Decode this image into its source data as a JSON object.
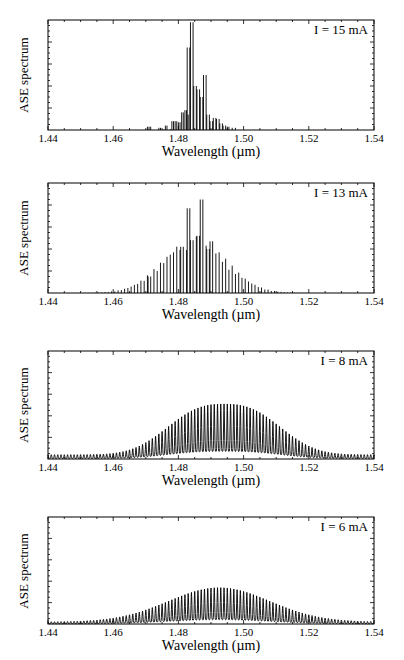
{
  "figure": {
    "panels": [
      {
        "id": "p1",
        "top": 20,
        "height": 110,
        "annotation": "I = 15 mA"
      },
      {
        "id": "p2",
        "top": 183,
        "height": 110,
        "annotation": "I = 13 mA"
      },
      {
        "id": "p3",
        "top": 351,
        "height": 108,
        "annotation": "I = 8 mA"
      },
      {
        "id": "p4",
        "top": 517,
        "height": 107,
        "annotation": "I = 6 mA"
      }
    ]
  },
  "chart_data": [
    {
      "type": "line",
      "title": "",
      "annotation": "I = 15 mA",
      "xlabel": "Wavelength (µm)",
      "ylabel": "ASE spectrum",
      "xlim": [
        1.44,
        1.54
      ],
      "ylim": [
        0,
        1
      ],
      "xticks": [
        "1.44",
        "1.46",
        "1.48",
        "1.50",
        "1.52",
        "1.54"
      ],
      "yticks_labeled": false,
      "grid": false,
      "description": "Narrow multimode spectrum concentrated 1.470-1.497 um; dominant longitudinal mode near 1.4837 um",
      "mode_spacing_um": 0.001,
      "envelope": {
        "center": 1.4845,
        "width": 0.004,
        "floor": 0.0
      },
      "peaks": [
        {
          "x": 1.471,
          "y": 0.03
        },
        {
          "x": 1.474,
          "y": 0.02
        },
        {
          "x": 1.476,
          "y": 0.04
        },
        {
          "x": 1.478,
          "y": 0.08
        },
        {
          "x": 1.479,
          "y": 0.08
        },
        {
          "x": 1.48,
          "y": 0.07
        },
        {
          "x": 1.481,
          "y": 0.16
        },
        {
          "x": 1.482,
          "y": 0.18
        },
        {
          "x": 1.483,
          "y": 0.14
        },
        {
          "x": 1.4827,
          "y": 0.75
        },
        {
          "x": 1.4837,
          "y": 0.98
        },
        {
          "x": 1.4847,
          "y": 0.4
        },
        {
          "x": 1.4857,
          "y": 0.37
        },
        {
          "x": 1.4867,
          "y": 0.3
        },
        {
          "x": 1.4877,
          "y": 0.5
        },
        {
          "x": 1.4887,
          "y": 0.14
        },
        {
          "x": 1.4897,
          "y": 0.08
        },
        {
          "x": 1.4907,
          "y": 0.11
        },
        {
          "x": 1.4917,
          "y": 0.1
        },
        {
          "x": 1.4927,
          "y": 0.06
        },
        {
          "x": 1.4937,
          "y": 0.04
        },
        {
          "x": 1.495,
          "y": 0.03
        },
        {
          "x": 1.4965,
          "y": 0.02
        }
      ]
    },
    {
      "type": "line",
      "title": "",
      "annotation": "I = 13 mA",
      "xlabel": "Wavelength (µm)",
      "ylabel": "ASE spectrum",
      "xlim": [
        1.44,
        1.54
      ],
      "ylim": [
        0,
        1
      ],
      "xticks": [
        "1.44",
        "1.46",
        "1.48",
        "1.50",
        "1.52",
        "1.54"
      ],
      "yticks_labeled": false,
      "grid": false,
      "description": "Broader modal comb 1.445-1.52 um with two dominant modes near 1.4827 and 1.4867 um",
      "mode_spacing_um": 0.001,
      "envelope": {
        "center": 1.485,
        "width": 0.0095,
        "peak": 0.45,
        "floor": 0.0
      },
      "peaks": [
        {
          "x": 1.4827,
          "y": 0.77
        },
        {
          "x": 1.4867,
          "y": 0.85
        },
        {
          "x": 1.4857,
          "y": 0.52
        },
        {
          "x": 1.4837,
          "y": 0.48
        },
        {
          "x": 1.4807,
          "y": 0.42
        },
        {
          "x": 1.4897,
          "y": 0.47
        },
        {
          "x": 1.4887,
          "y": 0.4
        },
        {
          "x": 1.4707,
          "y": 0.15
        }
      ]
    },
    {
      "type": "line",
      "title": "",
      "annotation": "I = 8 mA",
      "xlabel": "Wavelength (µm)",
      "ylabel": "ASE spectrum",
      "xlim": [
        1.44,
        1.54
      ],
      "ylim": [
        0,
        1
      ],
      "xticks": [
        "1.44",
        "1.46",
        "1.48",
        "1.50",
        "1.52",
        "1.54"
      ],
      "yticks_labeled": false,
      "grid": false,
      "description": "Dense Fabry-Perot modulated ASE spanning full range; flat-topped envelope centered ~1.494 um",
      "mode_spacing_um": 0.001,
      "envelope": {
        "center": 1.494,
        "width": 0.016,
        "peak": 0.47,
        "floor": 0.04,
        "flatness": 2.6,
        "modulation_min": 0.35
      }
    },
    {
      "type": "line",
      "title": "",
      "annotation": "I = 6 mA",
      "xlabel": "Wavelength (µm)",
      "ylabel": "ASE spectrum",
      "xlim": [
        1.44,
        1.54
      ],
      "ylim": [
        0,
        1
      ],
      "xticks": [
        "1.44",
        "1.46",
        "1.48",
        "1.50",
        "1.52",
        "1.54"
      ],
      "yticks_labeled": false,
      "grid": false,
      "description": "Dense Fabry-Perot modulated ASE; smooth Gaussian-like envelope centered ~1.492 um, lower amplitude",
      "mode_spacing_um": 0.001,
      "envelope": {
        "center": 1.4925,
        "width": 0.0155,
        "peak": 0.32,
        "floor": 0.02,
        "flatness": 2.0,
        "modulation_min": 0.3
      }
    }
  ],
  "colors": {
    "line": "#000000",
    "frame": "#000000",
    "background": "#ffffff"
  }
}
